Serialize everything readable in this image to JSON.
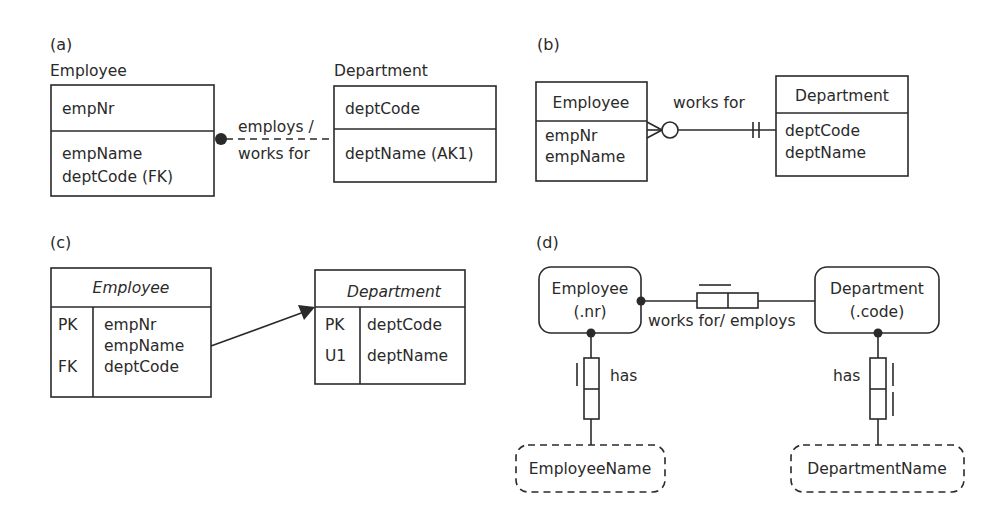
{
  "panels": {
    "a": {
      "label": "(a)",
      "employee": {
        "title": "Employee",
        "key_attrs": [
          "empNr"
        ],
        "attrs": [
          "empName",
          "deptCode (FK)"
        ]
      },
      "department": {
        "title": "Department",
        "key_attrs": [
          "deptCode"
        ],
        "attrs": [
          "deptName (AK1)"
        ]
      },
      "relationship": {
        "line1": "employs /",
        "line2": "works for"
      }
    },
    "b": {
      "label": "(b)",
      "employee": {
        "title": "Employee",
        "attrs": [
          "empNr",
          "empName"
        ]
      },
      "department": {
        "title": "Department",
        "attrs": [
          "deptCode",
          "deptName"
        ]
      },
      "relationship": {
        "label": "works for"
      }
    },
    "c": {
      "label": "(c)",
      "employee": {
        "title": "Employee",
        "rows": [
          {
            "key": "PK",
            "attr": "empNr"
          },
          {
            "key": "",
            "attr": "empName"
          },
          {
            "key": "FK",
            "attr": "deptCode"
          }
        ]
      },
      "department": {
        "title": "Department",
        "rows": [
          {
            "key": "PK",
            "attr": "deptCode"
          },
          {
            "key": "U1",
            "attr": "deptName"
          }
        ]
      }
    },
    "d": {
      "label": "(d)",
      "employee": {
        "name": "Employee",
        "refmode": "(.nr)"
      },
      "department": {
        "name": "Department",
        "refmode": "(.code)"
      },
      "fact": {
        "label": "works for/ employs"
      },
      "emp_has": {
        "label": "has",
        "value_type": "EmployeeName"
      },
      "dept_has": {
        "label": "has",
        "value_type": "DepartmentName"
      }
    }
  }
}
